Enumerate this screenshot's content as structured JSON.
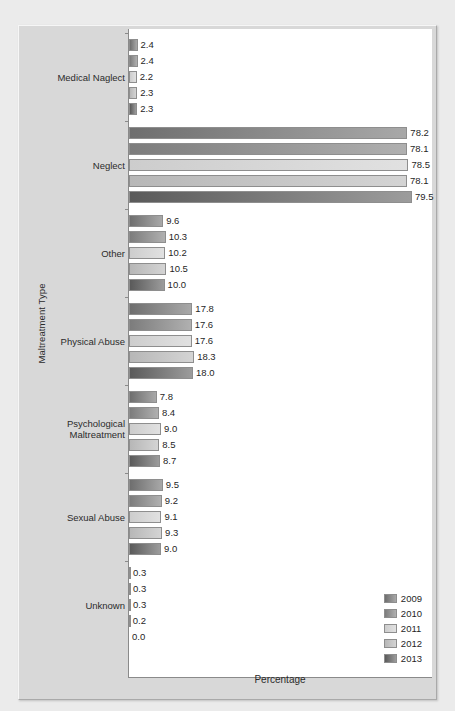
{
  "chart_data": {
    "type": "bar",
    "orientation": "horizontal",
    "title": "",
    "xlabel": "Percentage",
    "ylabel": "Maltreatment Type",
    "xlim": [
      0,
      100
    ],
    "grid": false,
    "legend_position": "bottom-right",
    "categories": [
      "Medical Naglect",
      "Neglect",
      "Other",
      "Physical Abuse",
      "Psychological\nMaltreatment",
      "Sexual Abuse",
      "Unknown"
    ],
    "series": [
      {
        "name": "2009",
        "color": "#6e6e6e",
        "values": [
          2.4,
          78.2,
          9.6,
          17.8,
          7.8,
          9.5,
          0.3
        ]
      },
      {
        "name": "2010",
        "color": "#7c7c7c",
        "values": [
          2.4,
          78.1,
          10.3,
          17.6,
          8.4,
          9.2,
          0.3
        ]
      },
      {
        "name": "2011",
        "color": "#cdcdcd",
        "values": [
          2.2,
          78.5,
          10.2,
          17.6,
          9.0,
          9.1,
          0.3
        ]
      },
      {
        "name": "2012",
        "color": "#b7b7b7",
        "values": [
          2.3,
          78.1,
          10.5,
          18.3,
          8.5,
          9.3,
          0.2
        ]
      },
      {
        "name": "2013",
        "color": "#5a5a5a",
        "values": [
          2.3,
          79.5,
          10.0,
          18.0,
          8.7,
          9.0,
          0.0
        ]
      }
    ],
    "value_labels": [
      [
        "2.4",
        "2.4",
        "2.2",
        "2.3",
        "2.3"
      ],
      [
        "78.2",
        "78.1",
        "78.5",
        "78.1",
        "79.5"
      ],
      [
        "9.6",
        "10.3",
        "10.2",
        "10.5",
        "10.0"
      ],
      [
        "17.8",
        "17.6",
        "17.6",
        "18.3",
        "18.0"
      ],
      [
        "7.8",
        "8.4",
        "9.0",
        "8.5",
        "8.7"
      ],
      [
        "9.5",
        "9.2",
        "9.1",
        "9.3",
        "9.0"
      ],
      [
        "0.3",
        "0.3",
        "0.3",
        "0.2",
        "0.0"
      ]
    ]
  },
  "legend": {
    "items": [
      {
        "label": "2009",
        "color": "#6e6e6e"
      },
      {
        "label": "2010",
        "color": "#7c7c7c"
      },
      {
        "label": "2011",
        "color": "#cdcdcd"
      },
      {
        "label": "2012",
        "color": "#b7b7b7"
      },
      {
        "label": "2013",
        "color": "#5a5a5a"
      }
    ]
  },
  "axes": {
    "x_title": "Percentage",
    "y_title": "Maltreatment Type"
  },
  "style": {
    "panel_bg": "#d8d8d8",
    "plot_bg": "#ffffff",
    "axis_color": "#8a8a8a",
    "text_color": "#2b2b2b"
  }
}
